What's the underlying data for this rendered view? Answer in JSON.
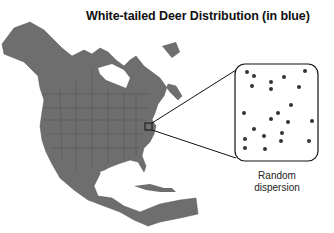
{
  "title": "White-tailed Deer Distribution (in blue)",
  "inset": {
    "caption_line1": "Random",
    "caption_line2": "dispersion",
    "dot_color": "#333333",
    "dots": [
      [
        247,
        72
      ],
      [
        254,
        76
      ],
      [
        252,
        86
      ],
      [
        271,
        82
      ],
      [
        284,
        77
      ],
      [
        305,
        71
      ],
      [
        271,
        89
      ],
      [
        299,
        87
      ],
      [
        291,
        105
      ],
      [
        244,
        113
      ],
      [
        278,
        113
      ],
      [
        271,
        119
      ],
      [
        288,
        122
      ],
      [
        312,
        121
      ],
      [
        254,
        129
      ],
      [
        264,
        136
      ],
      [
        282,
        133
      ],
      [
        245,
        139
      ],
      [
        281,
        141
      ],
      [
        309,
        141
      ],
      [
        245,
        148
      ],
      [
        265,
        149
      ]
    ]
  },
  "map": {
    "region": "North America",
    "land_color": "#6e6e6e",
    "highlight_box": {
      "x": 145,
      "y": 123,
      "w": 7,
      "h": 7
    }
  }
}
